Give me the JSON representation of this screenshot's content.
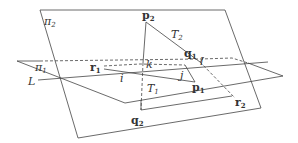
{
  "diagram": {
    "stroke_color": "#444444",
    "labels": {
      "pi2": {
        "base": "π",
        "sub": "2"
      },
      "pi1": {
        "base": "π",
        "sub": "1"
      },
      "L": "L",
      "p2": {
        "base": "p",
        "sub": "2"
      },
      "T2": {
        "base": "T",
        "sub": "2"
      },
      "q1": {
        "base": "q",
        "sub": "1"
      },
      "l": "l",
      "r1": {
        "base": "r",
        "sub": "1"
      },
      "k": "k",
      "i": "i",
      "j": "j",
      "p1": {
        "base": "p",
        "sub": "1"
      },
      "T1": {
        "base": "T",
        "sub": "1"
      },
      "r2": {
        "base": "r",
        "sub": "2"
      },
      "q2": {
        "base": "q",
        "sub": "2"
      }
    }
  }
}
